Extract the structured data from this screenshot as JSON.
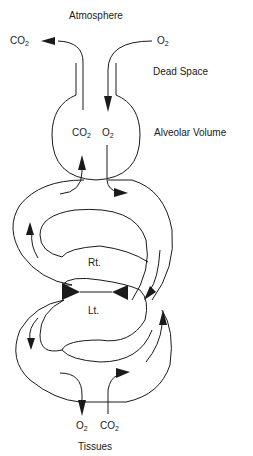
{
  "diagram": {
    "type": "respiratory gas exchange schematic",
    "labels": {
      "atmosphere": "Atmosphere",
      "dead_space": "Dead Space",
      "alveolar_volume": "Alveolar Volume",
      "tissues": "Tissues",
      "right_heart": "Rt.",
      "left_heart": "Lt."
    },
    "gases": {
      "top_left": {
        "base": "CO",
        "sub": "2"
      },
      "top_right": {
        "base": "O",
        "sub": "2"
      },
      "alveolar_left": {
        "base": "CO",
        "sub": "2"
      },
      "alveolar_right": {
        "base": "O",
        "sub": "2"
      },
      "bottom_left": {
        "base": "O",
        "sub": "2"
      },
      "bottom_right": {
        "base": "CO",
        "sub": "2"
      }
    },
    "colors": {
      "stroke": "#1a1a1a",
      "background": "#ffffff"
    }
  }
}
